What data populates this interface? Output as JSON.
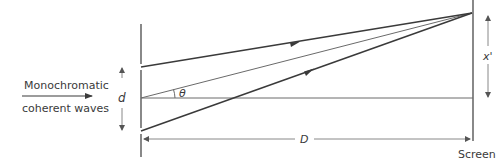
{
  "diagram": {
    "source_label_line1": "Monochromatic",
    "source_label_line2": "coherent waves",
    "slit_separation_label": "d",
    "angle_label": "θ",
    "distance_label": "D",
    "fringe_position_label": "x'",
    "screen_label": "Screen",
    "colors": {
      "line": "#3a3a3a",
      "thin_line": "#6a6a6a",
      "text": "#3a3a3a"
    }
  }
}
